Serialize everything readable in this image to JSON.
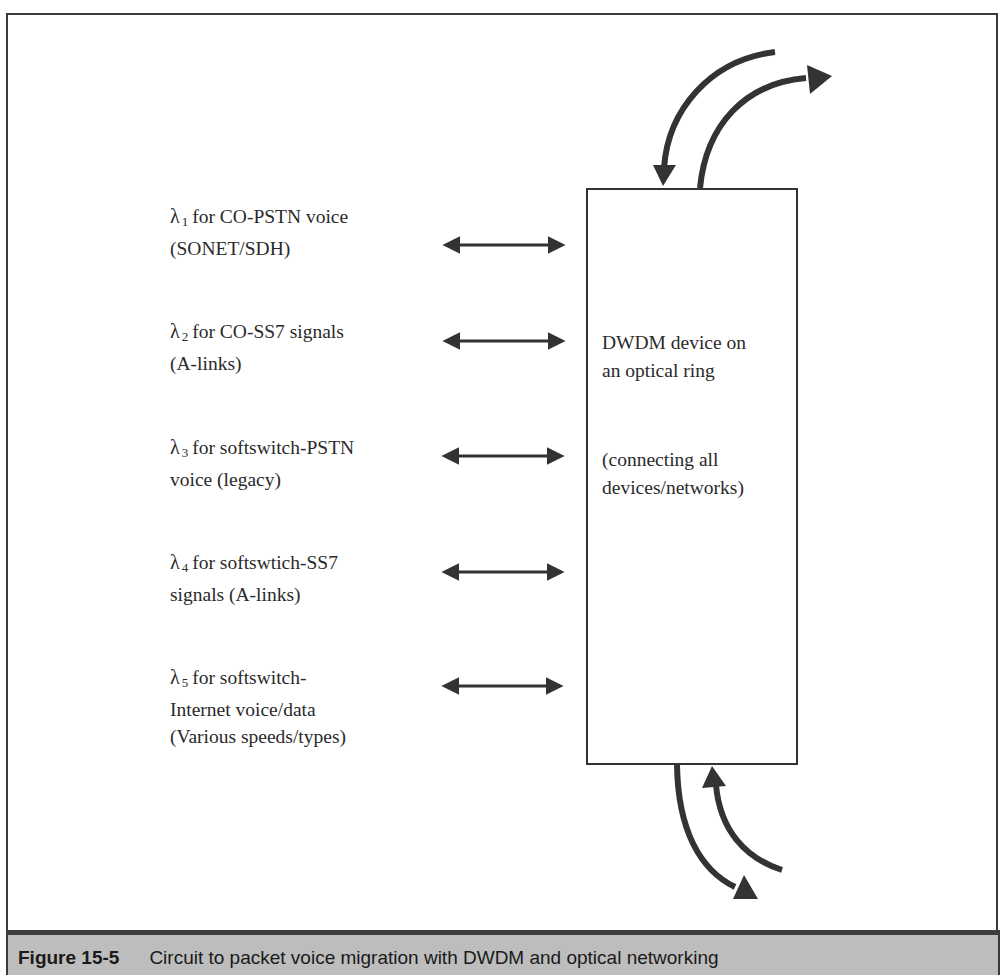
{
  "figure": {
    "number": "Figure 15-5",
    "caption": "Circuit to packet voice migration with DWDM and optical networking"
  },
  "device": {
    "title_line1": "DWDM device on",
    "title_line2": "an optical ring",
    "note_line1": "(connecting all",
    "note_line2": "devices/networks)"
  },
  "wavelengths": [
    {
      "symbol": "λ",
      "index": "1",
      "line1": "for CO-PSTN voice",
      "line2": "(SONET/SDH)",
      "line3": ""
    },
    {
      "symbol": "λ",
      "index": "2",
      "line1": "for CO-SS7 signals",
      "line2": "(A-links)",
      "line3": ""
    },
    {
      "symbol": "λ",
      "index": "3",
      "line1": "for softswitch-PSTN",
      "line2": "voice (legacy)",
      "line3": ""
    },
    {
      "symbol": "λ",
      "index": "4",
      "line1": "for softswtich-SS7",
      "line2": "signals (A-links)",
      "line3": ""
    },
    {
      "symbol": "λ",
      "index": "5",
      "line1": "for softswitch-",
      "line2": "Internet voice/data",
      "line3": "(Various speeds/types)"
    }
  ],
  "colors": {
    "line": "#333333",
    "caption_bg": "#bdbdbd",
    "separator": "#3d3d3d"
  }
}
